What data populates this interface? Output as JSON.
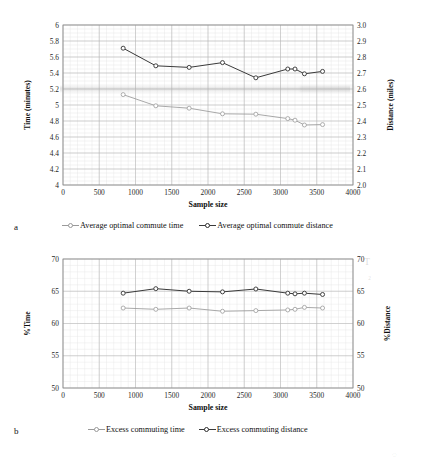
{
  "figure": {
    "panel_a_letter": "a",
    "panel_b_letter": "b"
  },
  "chart_data": [
    {
      "id": "panel-a",
      "type": "line",
      "title": "",
      "xlabel": "Sample size",
      "ylabel": "Time (minutes)",
      "y2label": "Distance (miles)",
      "xlim": [
        0,
        4000
      ],
      "ylim": [
        4,
        6
      ],
      "y2lim": [
        2.0,
        3.0
      ],
      "xticks": [
        0,
        500,
        1000,
        1500,
        2000,
        2500,
        3000,
        3500,
        4000
      ],
      "xticklabels": [
        "0",
        "500",
        "1000",
        "1500",
        "2000",
        "2500",
        "3000",
        "3500",
        "4000"
      ],
      "yticks": [
        4,
        4.2,
        4.4,
        4.6,
        4.8,
        5,
        5.2,
        5.4,
        5.6,
        5.8,
        6
      ],
      "yticklabels": [
        "4",
        "4.2",
        "4.4",
        "4.6",
        "4.8",
        "5",
        "5.2",
        "5.4",
        "5.6",
        "5.8",
        "6"
      ],
      "y2ticks": [
        2.0,
        2.1,
        2.2,
        2.3,
        2.4,
        2.5,
        2.6,
        2.7,
        2.8,
        2.9,
        3.0
      ],
      "y2ticklabels": [
        "2.0",
        "2.1",
        "2.2",
        "2.3",
        "2.4",
        "2.5",
        "2.6",
        "2.7",
        "2.8",
        "2.9",
        "3.0"
      ],
      "grid": true,
      "legend_position": "below",
      "x": [
        830,
        1280,
        1740,
        2200,
        2660,
        3100,
        3200,
        3330,
        3580
      ],
      "series": [
        {
          "name": "Average optimal commute time",
          "axis": "left",
          "color": "#9a9a9a",
          "x": [
            830,
            1280,
            1740,
            2200,
            2660,
            3100,
            3200,
            3330,
            3580
          ],
          "values": [
            5.13,
            4.99,
            4.96,
            4.89,
            4.885,
            4.83,
            4.81,
            4.75,
            4.755
          ]
        },
        {
          "name": "Average optimal commute distance",
          "axis": "right",
          "color": "#3a3a3a",
          "x": [
            830,
            1280,
            1740,
            2200,
            2660,
            3100,
            3200,
            3330,
            3580
          ],
          "values": [
            2.855,
            2.745,
            2.735,
            2.765,
            2.67,
            2.725,
            2.725,
            2.695,
            2.71
          ]
        }
      ],
      "legend": [
        {
          "label": "Average optimal commute time",
          "color": "#9a9a9a"
        },
        {
          "label": "Average optimal commute distance",
          "color": "#3a3a3a"
        }
      ]
    },
    {
      "id": "panel-b",
      "type": "line",
      "title": "",
      "xlabel": "Sample size",
      "ylabel": "%Time",
      "y2label": "%Distance",
      "xlim": [
        0,
        4000
      ],
      "ylim": [
        50,
        70
      ],
      "y2lim": [
        50,
        70
      ],
      "xticks": [
        0,
        500,
        1000,
        1500,
        2000,
        2500,
        3000,
        3500,
        4000
      ],
      "xticklabels": [
        "0",
        "500",
        "1000",
        "1500",
        "2000",
        "2500",
        "3000",
        "3500",
        "4000"
      ],
      "yticks": [
        50,
        55,
        60,
        65,
        70
      ],
      "yticklabels": [
        "50",
        "55",
        "60",
        "65",
        "70"
      ],
      "y2ticks": [
        50,
        55,
        60,
        65,
        70
      ],
      "y2ticklabels": [
        "50",
        "55",
        "60",
        "65",
        "70"
      ],
      "grid": true,
      "legend_position": "below",
      "x": [
        830,
        1280,
        1740,
        2200,
        2660,
        3100,
        3200,
        3330,
        3580
      ],
      "series": [
        {
          "name": "Excess commuting time",
          "axis": "left",
          "color": "#9a9a9a",
          "x": [
            830,
            1280,
            1740,
            2200,
            2660,
            3100,
            3200,
            3330,
            3580
          ],
          "values": [
            62.4,
            62.2,
            62.4,
            61.9,
            62.0,
            62.1,
            62.2,
            62.5,
            62.4
          ]
        },
        {
          "name": "Excess commuting distance",
          "axis": "right",
          "color": "#3a3a3a",
          "x": [
            830,
            1280,
            1740,
            2200,
            2660,
            3100,
            3200,
            3330,
            3580
          ],
          "values": [
            64.7,
            65.4,
            65.0,
            64.9,
            65.35,
            64.7,
            64.6,
            64.7,
            64.5
          ]
        }
      ],
      "legend": [
        {
          "label": "Excess commuting time",
          "color": "#9a9a9a"
        },
        {
          "label": "Excess commuting distance",
          "color": "#3a3a3a"
        }
      ]
    }
  ]
}
